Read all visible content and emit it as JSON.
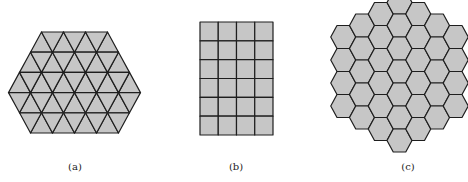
{
  "figure": {
    "panels": [
      {
        "id": "a",
        "label": "(a)",
        "tiling": "triangular",
        "label_x": 75,
        "fill": "#c6c6c6",
        "stroke": "#1e1e1e",
        "side": 22,
        "row_height": 20.2,
        "top_y": 32,
        "rows": [
          {
            "top_left": 41.5,
            "bottom_left": 30.5,
            "top_width_tris": 0,
            "up": 4,
            "down": 3
          },
          {
            "top_left": 30.5,
            "bottom_left": 19.5,
            "up": 5,
            "down": 4
          },
          {
            "top_left": 19.5,
            "bottom_left": 8.5,
            "up": 6,
            "down": 5
          },
          {
            "top_left": 8.5,
            "bottom_left": 19.5,
            "up": 5,
            "down": 6
          },
          {
            "top_left": 19.5,
            "bottom_left": 30.5,
            "up": 4,
            "down": 5
          }
        ]
      },
      {
        "id": "b",
        "label": "(b)",
        "tiling": "square",
        "label_x": 236,
        "fill": "#c6c6c6",
        "stroke": "#1e1e1e",
        "x": 200,
        "y": 22,
        "cols": 4,
        "rows": 6,
        "cell_w": 18.25,
        "cell_h": 18.83
      },
      {
        "id": "c",
        "label": "(c)",
        "tiling": "hexagonal",
        "label_x": 408,
        "fill": "#c6c6c6",
        "stroke": "#1e1e1e",
        "center_x": 399.5,
        "center_col_top": -9,
        "hex_radius": 12.5,
        "hex_height": 23,
        "column_counts": [
          4,
          5,
          6,
          7,
          6,
          5,
          4
        ]
      }
    ]
  }
}
